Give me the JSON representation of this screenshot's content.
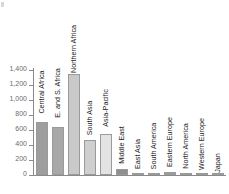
{
  "chart_data": {
    "type": "bar",
    "title": "",
    "subtitle": "",
    "xlabel": "",
    "ylabel": "",
    "ylim": [
      0,
      1400
    ],
    "grid": false,
    "legend": "none",
    "orientation": "vertical",
    "categories": [
      "Central Africa",
      "E. and S. Africa",
      "Northern Africa",
      "South Asia",
      "Asia-Pacific",
      "Middle East",
      "East Asia",
      "South America",
      "Eastern Europe",
      "North America",
      "Western Europe",
      "Japan"
    ],
    "values": [
      707,
      640,
      1347,
      467,
      547,
      80,
      10,
      13,
      40,
      5,
      5,
      2
    ],
    "bar_colors": [
      "#9e9e9e",
      "#a8a8a8",
      "#c9c9c9",
      "#cfcfcf",
      "#e3e3e3",
      "#8f8f8f",
      "#d0d0d0",
      "#c4c4c4",
      "#9c9c9c",
      "#dcdcdc",
      "#d6d6d6",
      "#e0e0e0"
    ],
    "yticks": [
      0,
      200,
      400,
      600,
      800,
      1000,
      1200,
      1400
    ],
    "ytick_labels": [
      "0",
      "200",
      "400",
      "600",
      "800",
      "1,000",
      "1,200",
      "1,400"
    ],
    "axis_color": "#8a8a8a",
    "tick_label_color": "#6b6b6b",
    "category_label_color": "#1a1a1a",
    "background": "#ffffff"
  }
}
